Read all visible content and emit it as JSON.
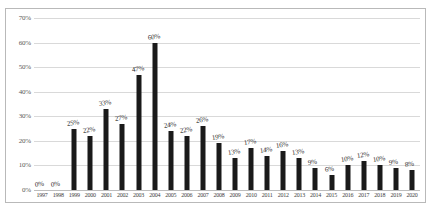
{
  "chart_data": {
    "type": "bar",
    "title": "",
    "xlabel": "",
    "ylabel": "",
    "ylim": [
      0,
      70
    ],
    "ytick_labels": [
      "0%",
      "10%",
      "20%",
      "30%",
      "40%",
      "50%",
      "60%",
      "70%"
    ],
    "ytick_values": [
      0,
      10,
      20,
      30,
      40,
      50,
      60,
      70
    ],
    "grid": true,
    "legend": "none",
    "bar_color": "#1a1a1a",
    "gridline_color": "#d9d9d9",
    "categories": [
      "1997",
      "1998",
      "1999",
      "2000",
      "2001",
      "2002",
      "2003",
      "2004",
      "2005",
      "2006",
      "2007",
      "2008",
      "2009",
      "2010",
      "2011",
      "2012",
      "2013",
      "2014",
      "2015",
      "2016",
      "2017",
      "2018",
      "2019",
      "2020"
    ],
    "values": [
      0,
      0,
      25,
      22,
      33,
      27,
      47,
      60,
      24,
      22,
      26,
      19,
      13,
      17,
      14,
      16,
      13,
      9,
      6,
      10,
      12,
      10,
      9,
      8
    ],
    "data_labels": [
      "0%",
      "0%",
      "25%",
      "22%",
      "33%",
      "27%",
      "47%",
      "60%",
      "24%",
      "22%",
      "26%",
      "19%",
      "13%",
      "17%",
      "14%",
      "16%",
      "13%",
      "9%",
      "6%",
      "10%",
      "12%",
      "10%",
      "9%",
      "8%"
    ]
  }
}
